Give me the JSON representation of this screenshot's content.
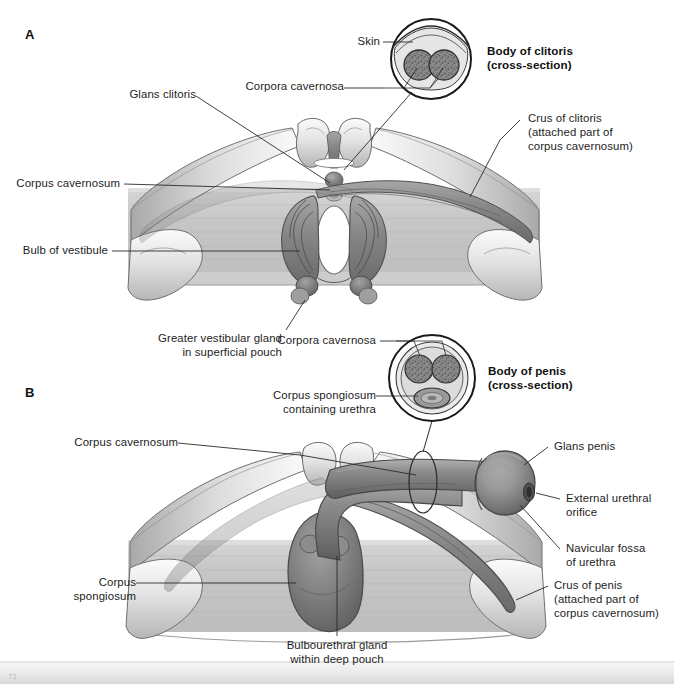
{
  "figure": {
    "kind": "anatomical-illustration",
    "style": "grayscale medical line-and-wash drawing",
    "panels": [
      {
        "letter": "A",
        "subject": "Female perineum — erectile tissues of the clitoris and bulbs of the vestibule",
        "inset_title_line1": "Body of clitoris",
        "inset_title_line2": "(cross-section)",
        "labels": [
          "Glans clitoris",
          "Corpora cavernosa",
          "Skin",
          "Crus of clitoris",
          "(attached part of",
          "corpus cavernosum)",
          "Corpus cavernosum",
          "Bulb of vestibule",
          "Greater vestibular gland",
          "in superficial pouch"
        ]
      },
      {
        "letter": "B",
        "subject": "Male perineum — erectile tissues of the penis, crura and bulb",
        "inset_title_line1": "Body of penis",
        "inset_title_line2": "(cross-section)",
        "labels": [
          "Corpora cavernosa",
          "Corpus spongiosum",
          "containing urethra",
          "Corpus cavernosum",
          "Glans penis",
          "External urethral",
          "orifice",
          "Navicular fossa",
          "of urethra",
          "Crus of penis",
          "(attached part of",
          "corpus cavernosum)",
          "Corpus",
          "spongiosum",
          "Bulbourethral gland",
          "within deep pouch"
        ]
      }
    ]
  },
  "panelA": {
    "letter": "A",
    "inset": {
      "title_line1": "Body of clitoris",
      "title_line2": "(cross-section)"
    },
    "labels": {
      "glans_clitoris": "Glans clitoris",
      "corpora_cavernosa": "Corpora cavernosa",
      "skin": "Skin",
      "crus_line1": "Crus of clitoris",
      "crus_line2": "(attached part of",
      "crus_line3": "corpus cavernosum)",
      "corpus_cavernosum": "Corpus cavernosum",
      "bulb_of_vestibule": "Bulb of vestibule",
      "greater_vestibular_line1": "Greater vestibular gland",
      "greater_vestibular_line2": "in superficial pouch"
    }
  },
  "panelB": {
    "letter": "B",
    "inset": {
      "title_line1": "Body of penis",
      "title_line2": "(cross-section)"
    },
    "labels": {
      "corpora_cavernosa": "Corpora cavernosa",
      "corpus_spongiosum_line1": "Corpus spongiosum",
      "corpus_spongiosum_line2": "containing urethra",
      "corpus_cavernosum": "Corpus cavernosum",
      "glans_penis": "Glans penis",
      "external_orifice_line1": "External urethral",
      "external_orifice_line2": "orifice",
      "navicular_line1": "Navicular fossa",
      "navicular_line2": "of urethra",
      "crus_line1": "Crus of penis",
      "crus_line2": "(attached part of",
      "crus_line3": "corpus cavernosum)",
      "corpus_spongiosum_left_line1": "Corpus",
      "corpus_spongiosum_left_line2": "spongiosum",
      "bulbourethral_line1": "Bulbourethral gland",
      "bulbourethral_line2": "within deep pouch"
    }
  },
  "colors": {
    "page_background": "#ffffff",
    "ink": "#1d1d1d",
    "leader_line": "#2a2a2a",
    "bone_light": "#f2f2f2",
    "bone_mid": "#d7d7d7",
    "bone_shadow": "#9a9a9a",
    "membrane": "#c9c9c9",
    "erectile_dark": "#6e6e6e",
    "erectile_mid": "#8e8e8e",
    "erectile_light": "#b5b5b5",
    "inset_outline": "#1a1a1a",
    "inset_fill": "#e4e4e4",
    "cavernosa_fill": "#7b7b7b",
    "footer_strip": "#e9e9e9"
  },
  "footer": {
    "page_mark": "71"
  }
}
